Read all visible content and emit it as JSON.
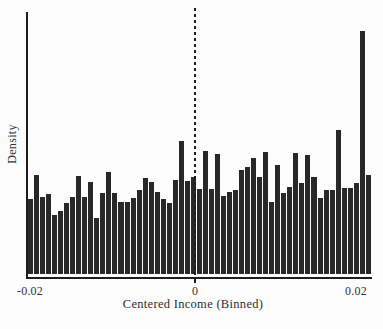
{
  "figure": {
    "background": "#fcfcfc",
    "bar_color": "#282828",
    "axis_color": "#1d1d1d",
    "text_color": "#333333"
  },
  "chart_data": {
    "type": "bar",
    "subtype": "histogram",
    "title": "",
    "xlabel": "Centered Income (Binned)",
    "ylabel": "Density",
    "x_tick_labels": [
      "-0.02",
      "0",
      "0.02"
    ],
    "x_tick_values": [
      -0.02,
      0,
      0.02
    ],
    "xlim": [
      -0.0205,
      0.0216
    ],
    "bin_start": -0.0205,
    "bin_width": 0.00074,
    "n_bins": 57,
    "values_unit": "relative density (fraction of plot height, no y scale printed)",
    "values": [
      0.287,
      0.379,
      0.295,
      0.307,
      0.226,
      0.241,
      0.272,
      0.295,
      0.375,
      0.295,
      0.352,
      0.215,
      0.31,
      0.391,
      0.31,
      0.276,
      0.276,
      0.291,
      0.322,
      0.368,
      0.352,
      0.314,
      0.287,
      0.272,
      0.36,
      0.51,
      0.356,
      0.372,
      0.326,
      0.471,
      0.326,
      0.46,
      0.299,
      0.314,
      0.322,
      0.398,
      0.41,
      0.444,
      0.372,
      0.467,
      0.276,
      0.418,
      0.31,
      0.333,
      0.464,
      0.349,
      0.456,
      0.372,
      0.291,
      0.322,
      0.322,
      0.552,
      0.33,
      0.33,
      0.349,
      0.931,
      0.379
    ],
    "reference_line": {
      "x": 0,
      "style": "dashed",
      "color": "#1d1d1d"
    },
    "y_axis_ticks": "none",
    "grid": false,
    "legend": "none"
  }
}
